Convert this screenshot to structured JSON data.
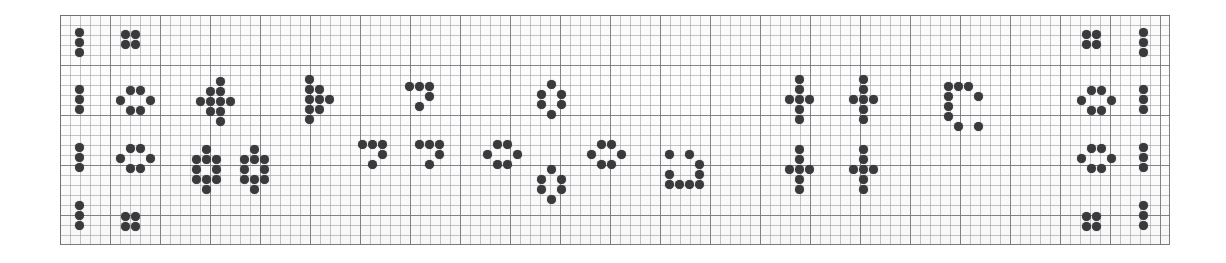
{
  "figure": {
    "kind": "dot-matrix-notation-sheet",
    "background_color": "#ffffff",
    "paper_color": "#fdfdfd",
    "dot_color": "#3a3a3c",
    "grid_minor_color": "#96989c",
    "grid_major_color": "#787a7e",
    "border_color": "#6e7074"
  },
  "grid": {
    "x": 60,
    "y": 15,
    "width": 1110,
    "height": 230,
    "cell_size": 10,
    "major_every": 5,
    "columns": 111,
    "rows": 23
  },
  "dot": {
    "diameter": 9,
    "pitch": 10
  },
  "glyphs": [
    {
      "name": "bar-three-top-left",
      "symbol": "vertical-tri",
      "x": 75,
      "y": 28,
      "cells": [
        [
          0,
          0
        ],
        [
          0,
          1
        ],
        [
          0,
          2
        ]
      ]
    },
    {
      "name": "square-four-top",
      "symbol": "quad",
      "x": 121,
      "y": 30,
      "cells": [
        [
          0,
          0
        ],
        [
          1,
          0
        ],
        [
          0,
          1
        ],
        [
          1,
          1
        ]
      ]
    },
    {
      "name": "bar-three-row2-left",
      "symbol": "vertical-tri",
      "x": 75,
      "y": 85,
      "cells": [
        [
          0,
          0
        ],
        [
          0,
          1
        ],
        [
          0,
          2
        ]
      ]
    },
    {
      "name": "hex-six-row2",
      "symbol": "hex",
      "x": 116,
      "y": 86,
      "cells": [
        [
          1,
          0
        ],
        [
          2,
          0
        ],
        [
          0,
          1
        ],
        [
          3,
          1
        ],
        [
          1,
          2
        ],
        [
          2,
          2
        ]
      ]
    },
    {
      "name": "arrow-cluster-row2",
      "symbol": "arrow-up-right",
      "x": 196,
      "y": 77,
      "cells": [
        [
          2,
          0
        ],
        [
          1,
          1
        ],
        [
          2,
          1
        ],
        [
          0,
          2
        ],
        [
          1,
          2
        ],
        [
          2,
          2
        ],
        [
          3,
          2
        ],
        [
          1,
          3
        ],
        [
          2,
          3
        ],
        [
          2,
          4
        ]
      ]
    },
    {
      "name": "flag-cluster-row2",
      "symbol": "flag",
      "x": 305,
      "y": 75,
      "cells": [
        [
          0,
          0
        ],
        [
          0,
          1
        ],
        [
          1,
          1
        ],
        [
          0,
          2
        ],
        [
          1,
          2
        ],
        [
          2,
          2
        ],
        [
          0,
          3
        ],
        [
          1,
          3
        ],
        [
          0,
          4
        ]
      ]
    },
    {
      "name": "seven-glyph-a",
      "symbol": "seven",
      "x": 405,
      "y": 82,
      "cells": [
        [
          0,
          0
        ],
        [
          1,
          0
        ],
        [
          2,
          0
        ],
        [
          2,
          1
        ],
        [
          1,
          2
        ]
      ]
    },
    {
      "name": "ring-six-upper",
      "symbol": "hex-ring",
      "x": 537,
      "y": 80,
      "cells": [
        [
          1,
          0
        ],
        [
          0,
          1
        ],
        [
          2,
          1
        ],
        [
          0,
          2
        ],
        [
          2,
          2
        ],
        [
          1,
          3
        ]
      ]
    },
    {
      "name": "dagger-upper-a",
      "symbol": "dagger",
      "x": 785,
      "y": 75,
      "cells": [
        [
          1,
          0
        ],
        [
          1,
          1
        ],
        [
          0,
          2
        ],
        [
          1,
          2
        ],
        [
          2,
          2
        ],
        [
          1,
          3
        ],
        [
          1,
          4
        ]
      ]
    },
    {
      "name": "dagger-upper-b",
      "symbol": "dagger",
      "x": 849,
      "y": 75,
      "cells": [
        [
          1,
          0
        ],
        [
          1,
          1
        ],
        [
          0,
          2
        ],
        [
          1,
          2
        ],
        [
          2,
          2
        ],
        [
          1,
          3
        ],
        [
          1,
          4
        ]
      ]
    },
    {
      "name": "bracket-c-upper",
      "symbol": "bracket-c",
      "x": 944,
      "y": 82,
      "cells": [
        [
          0,
          0
        ],
        [
          1,
          0
        ],
        [
          2,
          0
        ],
        [
          0,
          1
        ],
        [
          3,
          1
        ],
        [
          0,
          2
        ],
        [
          0,
          3
        ],
        [
          1,
          4
        ],
        [
          3,
          4
        ]
      ]
    },
    {
      "name": "square-four-right-top",
      "symbol": "quad",
      "x": 1082,
      "y": 30,
      "cells": [
        [
          0,
          0
        ],
        [
          1,
          0
        ],
        [
          0,
          1
        ],
        [
          1,
          1
        ]
      ]
    },
    {
      "name": "bar-three-right-top",
      "symbol": "vertical-tri",
      "x": 1139,
      "y": 28,
      "cells": [
        [
          0,
          0
        ],
        [
          0,
          1
        ],
        [
          0,
          2
        ]
      ]
    },
    {
      "name": "hex-six-right-row2",
      "symbol": "hex",
      "x": 1077,
      "y": 86,
      "cells": [
        [
          1,
          0
        ],
        [
          2,
          0
        ],
        [
          0,
          1
        ],
        [
          3,
          1
        ],
        [
          1,
          2
        ],
        [
          2,
          2
        ]
      ]
    },
    {
      "name": "bar-three-right-row2",
      "symbol": "vertical-tri",
      "x": 1139,
      "y": 85,
      "cells": [
        [
          0,
          0
        ],
        [
          0,
          1
        ],
        [
          0,
          2
        ]
      ]
    },
    {
      "name": "bar-three-row3-left",
      "symbol": "vertical-tri",
      "x": 75,
      "y": 143,
      "cells": [
        [
          0,
          0
        ],
        [
          0,
          1
        ],
        [
          0,
          2
        ]
      ]
    },
    {
      "name": "hex-six-row3",
      "symbol": "hex",
      "x": 116,
      "y": 144,
      "cells": [
        [
          1,
          0
        ],
        [
          2,
          0
        ],
        [
          0,
          1
        ],
        [
          3,
          1
        ],
        [
          1,
          2
        ],
        [
          2,
          2
        ]
      ]
    },
    {
      "name": "w-cluster-row3-a",
      "symbol": "w-shape",
      "x": 192,
      "y": 145,
      "cells": [
        [
          1,
          0
        ],
        [
          0,
          1
        ],
        [
          1,
          1
        ],
        [
          2,
          1
        ],
        [
          0,
          2
        ],
        [
          2,
          2
        ],
        [
          0,
          3
        ],
        [
          1,
          3
        ],
        [
          2,
          3
        ],
        [
          1,
          4
        ]
      ]
    },
    {
      "name": "w-cluster-row3-b",
      "symbol": "w-shape",
      "x": 240,
      "y": 145,
      "cells": [
        [
          1,
          0
        ],
        [
          0,
          1
        ],
        [
          1,
          1
        ],
        [
          2,
          1
        ],
        [
          0,
          2
        ],
        [
          2,
          2
        ],
        [
          0,
          3
        ],
        [
          1,
          3
        ],
        [
          2,
          3
        ],
        [
          1,
          4
        ]
      ]
    },
    {
      "name": "seven-glyph-b",
      "symbol": "seven",
      "x": 358,
      "y": 140,
      "cells": [
        [
          0,
          0
        ],
        [
          1,
          0
        ],
        [
          2,
          0
        ],
        [
          2,
          1
        ],
        [
          1,
          2
        ]
      ]
    },
    {
      "name": "seven-glyph-c",
      "symbol": "seven",
      "x": 415,
      "y": 140,
      "cells": [
        [
          0,
          0
        ],
        [
          1,
          0
        ],
        [
          2,
          0
        ],
        [
          2,
          1
        ],
        [
          1,
          2
        ]
      ]
    },
    {
      "name": "ring-six-left",
      "symbol": "hex-ring",
      "x": 483,
      "y": 140,
      "cells": [
        [
          1,
          0
        ],
        [
          2,
          0
        ],
        [
          0,
          1
        ],
        [
          3,
          1
        ],
        [
          1,
          2
        ],
        [
          2,
          2
        ]
      ]
    },
    {
      "name": "ring-six-right",
      "symbol": "hex-ring",
      "x": 587,
      "y": 140,
      "cells": [
        [
          1,
          0
        ],
        [
          2,
          0
        ],
        [
          0,
          1
        ],
        [
          3,
          1
        ],
        [
          1,
          2
        ],
        [
          2,
          2
        ]
      ]
    },
    {
      "name": "ring-six-lower",
      "symbol": "hex-ring",
      "x": 537,
      "y": 165,
      "cells": [
        [
          1,
          0
        ],
        [
          0,
          1
        ],
        [
          2,
          1
        ],
        [
          0,
          2
        ],
        [
          2,
          2
        ],
        [
          1,
          3
        ]
      ]
    },
    {
      "name": "j-glyph",
      "symbol": "j-hook",
      "x": 665,
      "y": 150,
      "cells": [
        [
          0,
          0
        ],
        [
          2,
          0
        ],
        [
          3,
          1
        ],
        [
          0,
          2
        ],
        [
          3,
          2
        ],
        [
          0,
          3
        ],
        [
          1,
          3
        ],
        [
          2,
          3
        ],
        [
          3,
          3
        ]
      ]
    },
    {
      "name": "dagger-lower-a",
      "symbol": "dagger",
      "x": 785,
      "y": 145,
      "cells": [
        [
          1,
          0
        ],
        [
          1,
          1
        ],
        [
          0,
          2
        ],
        [
          1,
          2
        ],
        [
          2,
          2
        ],
        [
          1,
          3
        ],
        [
          1,
          4
        ]
      ]
    },
    {
      "name": "dagger-lower-b",
      "symbol": "dagger",
      "x": 849,
      "y": 145,
      "cells": [
        [
          1,
          0
        ],
        [
          1,
          1
        ],
        [
          0,
          2
        ],
        [
          1,
          2
        ],
        [
          2,
          2
        ],
        [
          1,
          3
        ],
        [
          1,
          4
        ]
      ]
    },
    {
      "name": "hex-six-right-row3",
      "symbol": "hex",
      "x": 1077,
      "y": 144,
      "cells": [
        [
          1,
          0
        ],
        [
          2,
          0
        ],
        [
          0,
          1
        ],
        [
          3,
          1
        ],
        [
          1,
          2
        ],
        [
          2,
          2
        ]
      ]
    },
    {
      "name": "bar-three-right-row3",
      "symbol": "vertical-tri",
      "x": 1139,
      "y": 143,
      "cells": [
        [
          0,
          0
        ],
        [
          0,
          1
        ],
        [
          0,
          2
        ]
      ]
    },
    {
      "name": "bar-three-row4-left",
      "symbol": "vertical-tri",
      "x": 75,
      "y": 201,
      "cells": [
        [
          0,
          0
        ],
        [
          0,
          1
        ],
        [
          0,
          2
        ]
      ]
    },
    {
      "name": "square-four-bottom",
      "symbol": "quad",
      "x": 121,
      "y": 212,
      "cells": [
        [
          0,
          0
        ],
        [
          1,
          0
        ],
        [
          0,
          1
        ],
        [
          1,
          1
        ]
      ]
    },
    {
      "name": "square-four-right-bottom",
      "symbol": "quad",
      "x": 1082,
      "y": 212,
      "cells": [
        [
          0,
          0
        ],
        [
          1,
          0
        ],
        [
          0,
          1
        ],
        [
          1,
          1
        ]
      ]
    },
    {
      "name": "bar-three-right-bottom",
      "symbol": "vertical-tri",
      "x": 1139,
      "y": 201,
      "cells": [
        [
          0,
          0
        ],
        [
          0,
          1
        ],
        [
          0,
          2
        ]
      ]
    }
  ]
}
